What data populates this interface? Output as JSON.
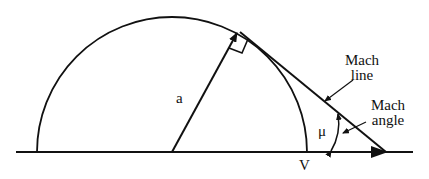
{
  "labels": {
    "radius": "a",
    "velocity": "V",
    "mach_line_1": "Mach",
    "mach_line_2": "line",
    "mach_angle_1": "Mach",
    "mach_angle_2": "angle",
    "mu": "μ"
  },
  "colors": {
    "stroke": "#111111",
    "background": "#ffffff"
  }
}
